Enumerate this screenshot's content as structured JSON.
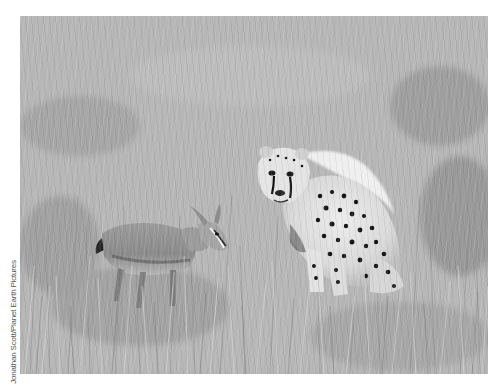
{
  "photo": {
    "subject": "cheetah cub and gazelle fawn in tall grass",
    "style": "black-and-white",
    "colors": {
      "grass_light": "#bdbdbd",
      "grass_mid": "#a8a8a8",
      "grass_dark": "#7c7c7c",
      "cheetah_fur": "#e6e6e6",
      "spots": "#1a1a1a",
      "gazelle_body": "#8f8f8f",
      "page_background": "#ffffff"
    }
  },
  "credit": {
    "text": "Jonathan Scott/Planet Earth Pictures"
  }
}
